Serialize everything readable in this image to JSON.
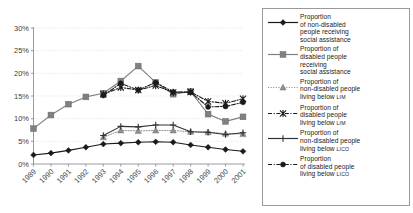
{
  "chart_data": {
    "type": "line",
    "title": "",
    "xlabel": "",
    "ylabel": "",
    "ylim": [
      0,
      30
    ],
    "ytick_labels": [
      "0%",
      "5%",
      "10%",
      "15%",
      "20%",
      "25%",
      "30%"
    ],
    "ytick_values": [
      0,
      5,
      10,
      15,
      20,
      25,
      30
    ],
    "grid": true,
    "legend_position": "right",
    "categories": [
      "1989",
      "1990",
      "1991",
      "1992",
      "1993",
      "1994",
      "1995",
      "1996",
      "1997",
      "1998",
      "1999",
      "2000",
      "2001"
    ],
    "x": [
      1989,
      1990,
      1991,
      1992,
      1993,
      1994,
      1995,
      1996,
      1997,
      1998,
      1999,
      2000,
      2001
    ],
    "series": [
      {
        "name": "Proportion of non-disabled people receiving social assistance",
        "key": "nondisabled-social-assistance",
        "marker": "diamond",
        "line": "solid",
        "color": "#1a1a1a",
        "x": [
          1989,
          1990,
          1991,
          1992,
          1993,
          1994,
          1995,
          1996,
          1997,
          1998,
          1999,
          2000,
          2001
        ],
        "values": [
          2.0,
          2.4,
          3.0,
          3.7,
          4.4,
          4.6,
          4.8,
          4.9,
          4.8,
          4.2,
          3.7,
          3.2,
          2.8
        ]
      },
      {
        "name": "Proportion of disabled people receiving social assistance",
        "key": "disabled-social-assistance",
        "marker": "square",
        "line": "solid",
        "color": "#808080",
        "x": [
          1989,
          1990,
          1991,
          1992,
          1993,
          1994,
          1995,
          1996,
          1997,
          1998,
          1999,
          2000,
          2001
        ],
        "values": [
          7.8,
          10.8,
          13.2,
          14.8,
          15.6,
          18.3,
          21.6,
          18.0,
          15.4,
          16.0,
          11.0,
          9.4,
          10.4
        ]
      },
      {
        "name": "Proportion of non-disabled people living below LIM",
        "key": "nondisabled-lim",
        "marker": "triangle",
        "line": "dotted",
        "color": "#909090",
        "x": [
          1993,
          1994,
          1995,
          1996,
          1997,
          1998,
          1999,
          2000,
          2001
        ],
        "values": [
          5.9,
          7.4,
          7.3,
          7.4,
          7.4,
          7.1,
          7.0,
          6.7,
          6.6
        ]
      },
      {
        "name": "Proportion of disabled people living below LIM",
        "key": "disabled-lim",
        "marker": "asterisk",
        "line": "dash-dot",
        "color": "#1a1a1a",
        "x": [
          1993,
          1994,
          1995,
          1996,
          1997,
          1998,
          1999,
          2000,
          2001
        ],
        "values": [
          15.4,
          16.9,
          16.3,
          17.3,
          15.8,
          15.9,
          13.8,
          13.4,
          14.4
        ]
      },
      {
        "name": "Proportion of non-disabled people living below LICO",
        "key": "nondisabled-lico",
        "marker": "plus",
        "line": "solid",
        "color": "#333333",
        "x": [
          1993,
          1994,
          1995,
          1996,
          1997,
          1998,
          1999,
          2000,
          2001
        ],
        "values": [
          6.3,
          8.3,
          8.2,
          8.6,
          8.6,
          7.1,
          7.0,
          6.5,
          6.9
        ]
      },
      {
        "name": "Proportion of disabled people living below LICO",
        "key": "disabled-lico",
        "marker": "circle-dot",
        "line": "dash-dot",
        "color": "#1a1a1a",
        "x": [
          1993,
          1994,
          1995,
          1996,
          1997,
          1998,
          1999,
          2000,
          2001
        ],
        "values": [
          15.1,
          17.8,
          16.3,
          18.0,
          15.9,
          15.8,
          12.6,
          12.7,
          13.6
        ]
      }
    ]
  },
  "legend": {
    "entries": [
      {
        "line1": "Proportion",
        "line2": "of non-disabled",
        "line3": "people receiving",
        "line4": "social assistance",
        "small": ""
      },
      {
        "line1": "Proportion of",
        "line2": "disabled people",
        "line3": "receiving",
        "line4": "social assistance",
        "small": ""
      },
      {
        "line1": "Proportion of",
        "line2": "non-disabled people",
        "line3": "living below ",
        "line4": "",
        "small": "LIM"
      },
      {
        "line1": "Proportion of",
        "line2": "disabled people",
        "line3": "living below ",
        "line4": "",
        "small": "LIM"
      },
      {
        "line1": "Proportion of",
        "line2": "non-disabled people",
        "line3": "living below ",
        "line4": "",
        "small": "LICO"
      },
      {
        "line1": "Proportion",
        "line2": "of disabled people",
        "line3": "living below ",
        "line4": "",
        "small": "LICO"
      }
    ]
  }
}
